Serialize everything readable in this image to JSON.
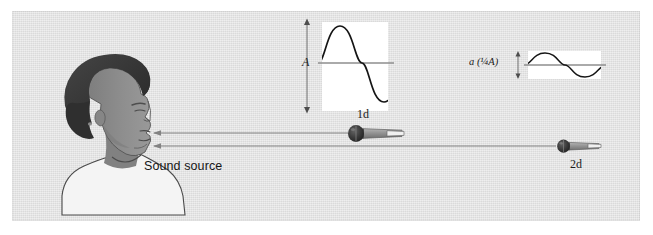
{
  "figure": {
    "kind": "physics-illustration",
    "topic": "sound-amplitude-vs-distance",
    "background_color": "#e2e2e2",
    "page_color": "#ffffff"
  },
  "labels": {
    "sound_source": "Sound source",
    "near_mic_distance": "1d",
    "far_mic_distance": "2d",
    "near_amplitude": "A",
    "far_amplitude": "a (¼A)"
  },
  "waveforms": [
    {
      "name": "near-waveform",
      "amplitude_label": "A",
      "relative_amplitude": 1.0,
      "cycles": 1,
      "box_color": "#ffffff",
      "stroke_color": "#111111",
      "baseline_color": "#8e8e8e"
    },
    {
      "name": "far-waveform",
      "amplitude_label": "a (¼A)",
      "relative_amplitude": 0.25,
      "cycles": 1,
      "box_color": "#ffffff",
      "stroke_color": "#111111",
      "baseline_color": "#8e8e8e"
    }
  ],
  "microphones": [
    {
      "name": "near-microphone",
      "distance_label": "1d",
      "scale": 1.0
    },
    {
      "name": "far-microphone",
      "distance_label": "2d",
      "scale": 0.78
    }
  ],
  "sound_rays": [
    {
      "name": "ray-to-near-mic",
      "direction": "leftward",
      "target": "mouth"
    },
    {
      "name": "ray-to-far-mic",
      "direction": "leftward",
      "target": "mouth"
    }
  ],
  "person": {
    "name": "speaker-profile",
    "facing": "right",
    "hair_color": "#3a3a3a",
    "skin_color": "#8c8c8c",
    "shirt_color": "#f4f4f4"
  },
  "colors": {
    "panel": "#e2e2e2",
    "ray_line": "#7b7b7b",
    "mic_body": "#8f8f8f",
    "mic_head": "#2e2e2e",
    "mic_tip": "#f2f2f2",
    "ink": "#1b1b1b"
  }
}
